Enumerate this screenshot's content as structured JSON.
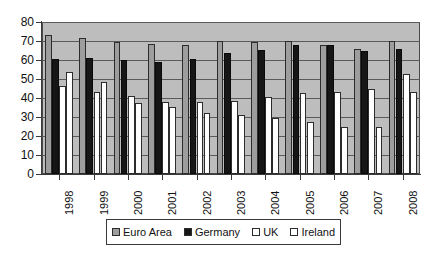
{
  "chart_data": {
    "type": "bar",
    "title": "",
    "subtitle": "",
    "xlabel": "",
    "ylabel": "",
    "ylim": [
      0,
      80
    ],
    "ytick_step": 10,
    "yticks": [
      "80",
      "70",
      "60",
      "50",
      "40",
      "30",
      "20",
      "10",
      "0"
    ],
    "grid": true,
    "grid_axis": "y",
    "legend_position": "bottom",
    "categories": [
      "1998",
      "1999",
      "2000",
      "2001",
      "2002",
      "2003",
      "2004",
      "2005",
      "2006",
      "2007",
      "2008"
    ],
    "series": [
      {
        "name": "Euro Area",
        "color": "#9d9d9d",
        "values": [
          73.0,
          71.8,
          69.6,
          68.6,
          67.8,
          70.0,
          69.7,
          70.2,
          68.0,
          66.0,
          69.8
        ]
      },
      {
        "name": "Germany",
        "color": "#161616",
        "values": [
          60.5,
          61.0,
          60.0,
          59.0,
          60.6,
          63.8,
          65.4,
          68.0,
          67.9,
          65.0,
          66.0
        ]
      },
      {
        "name": "UK",
        "color": "#ffffff",
        "values": [
          46.5,
          43.2,
          41.2,
          37.8,
          37.8,
          38.6,
          40.5,
          42.4,
          43.3,
          44.6,
          52.5
        ]
      },
      {
        "name": "Ireland",
        "color": "#ffffff",
        "values": [
          53.8,
          48.4,
          37.5,
          35.4,
          32.2,
          31.2,
          29.4,
          27.2,
          24.6,
          24.6,
          43.4
        ]
      }
    ]
  },
  "legend": {
    "items": [
      {
        "label": "Euro Area",
        "swatch": "euro"
      },
      {
        "label": "Germany",
        "swatch": "germany"
      },
      {
        "label": "UK",
        "swatch": "uk"
      },
      {
        "label": "Ireland",
        "swatch": "ireland"
      }
    ]
  }
}
